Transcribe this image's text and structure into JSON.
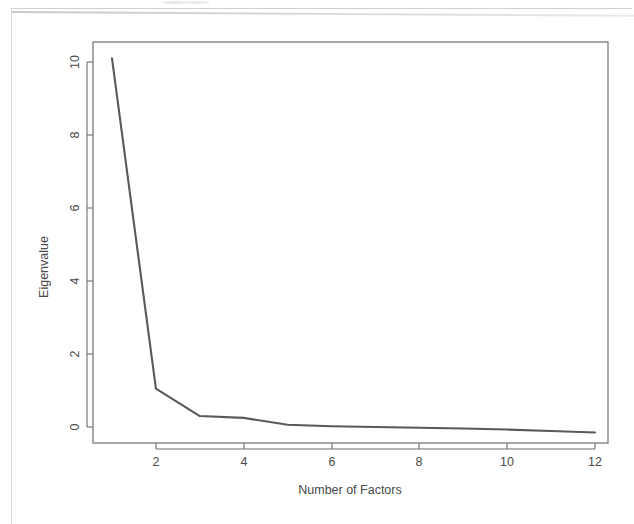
{
  "page": {
    "background_color": "#ffffff",
    "frame_color": "#d8d8d8"
  },
  "chart_data": {
    "type": "line",
    "title": "",
    "subtitle": "",
    "xlabel": "Number of Factors",
    "ylabel": "Eigenvalue",
    "x": [
      1,
      2,
      3,
      4,
      5,
      6,
      7,
      8,
      9,
      10,
      11,
      12
    ],
    "values": [
      10.1,
      1.05,
      0.3,
      0.25,
      0.06,
      0.02,
      0.0,
      -0.02,
      -0.04,
      -0.07,
      -0.11,
      -0.15
    ],
    "series": [
      {
        "name": "Eigenvalue",
        "values": [
          10.1,
          1.05,
          0.3,
          0.25,
          0.06,
          0.02,
          0.0,
          -0.02,
          -0.04,
          -0.07,
          -0.11,
          -0.15
        ]
      }
    ],
    "xlim": [
      0.55,
      12.55
    ],
    "ylim": [
      -0.45,
      10.6
    ],
    "xticks": [
      2,
      4,
      6,
      8,
      10,
      12
    ],
    "yticks": [
      0,
      2,
      4,
      6,
      8,
      10
    ],
    "xtick_labels": [
      "2",
      "4",
      "6",
      "8",
      "10",
      "12"
    ],
    "ytick_labels": [
      "0",
      "2",
      "4",
      "6",
      "8",
      "10"
    ],
    "grid": false,
    "legend": false,
    "legend_position": "none",
    "line_color": "#595959",
    "line_width": 2.1,
    "markers": false,
    "axis_color": "#6e6e6e",
    "plot_box": true,
    "ylabel_rotation": -90,
    "tick_label_rotation": -90
  }
}
